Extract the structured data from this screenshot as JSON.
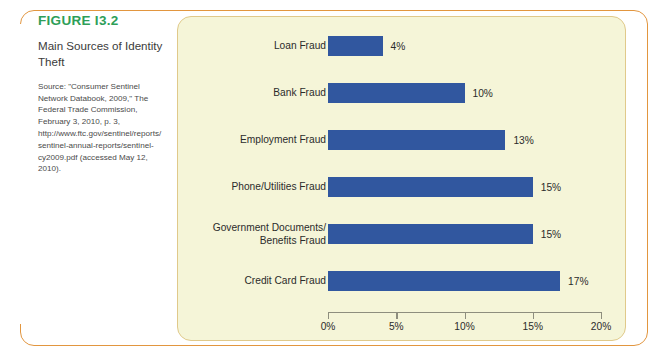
{
  "figure": {
    "number": "FIGURE I3.2",
    "title": "Main Sources of Identity Theft",
    "source": "Source: \"Consumer Sentinel Network Databook, 2009,\" The Federal Trade Commission, February 3, 2010, p. 3, http://www.ftc.gov/sentinel/reports/sentinel-annual-reports/sentinel-cy2009.pdf (accessed May 12, 2010)."
  },
  "colors": {
    "bar": "#31579f",
    "figure_number": "#2e9e58",
    "panel_background": "#f5f5d8",
    "frame_border": "#e2963f",
    "panel_border": "#e0c98a",
    "axis": "#8e8e7e"
  },
  "chart_data": {
    "type": "bar",
    "orientation": "horizontal",
    "title": "Main Sources of Identity Theft",
    "xlabel": "",
    "ylabel": "",
    "xlim": [
      0,
      20
    ],
    "xticks": [
      0,
      5,
      10,
      15,
      20
    ],
    "xtick_labels": [
      "0%",
      "5%",
      "10%",
      "15%",
      "20%"
    ],
    "grid": false,
    "legend": false,
    "value_suffix": "%",
    "categories": [
      "Loan Fraud",
      "Bank Fraud",
      "Employment Fraud",
      "Phone/Utilities Fraud",
      "Government Documents/\nBenefits Fraud",
      "Credit Card Fraud"
    ],
    "values": [
      4,
      10,
      13,
      15,
      15,
      17
    ],
    "data_labels": [
      "4%",
      "10%",
      "13%",
      "15%",
      "15%",
      "17%"
    ],
    "bars": [
      {
        "label": "Loan Fraud",
        "label_line1": "Loan Fraud",
        "label_line2": "",
        "value": 4,
        "data_label": "4%"
      },
      {
        "label": "Bank Fraud",
        "label_line1": "Bank Fraud",
        "label_line2": "",
        "value": 10,
        "data_label": "10%"
      },
      {
        "label": "Employment Fraud",
        "label_line1": "Employment Fraud",
        "label_line2": "",
        "value": 13,
        "data_label": "13%"
      },
      {
        "label": "Phone/Utilities Fraud",
        "label_line1": "Phone/Utilities Fraud",
        "label_line2": "",
        "value": 15,
        "data_label": "15%"
      },
      {
        "label": "Government Documents/ Benefits Fraud",
        "label_line1": "Government Documents/",
        "label_line2": "Benefits Fraud",
        "value": 15,
        "data_label": "15%"
      },
      {
        "label": "Credit Card Fraud",
        "label_line1": "Credit Card Fraud",
        "label_line2": "",
        "value": 17,
        "data_label": "17%"
      }
    ]
  }
}
